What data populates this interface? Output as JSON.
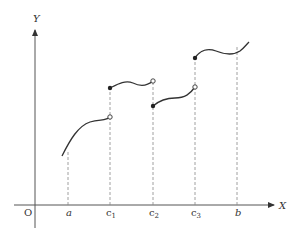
{
  "axes": {
    "x_label": "X",
    "y_label": "Y",
    "origin_label": "O"
  },
  "ticks": [
    {
      "id": "a",
      "label": "a",
      "x": 68
    },
    {
      "id": "c1",
      "label": "c",
      "sub": "1",
      "x": 110
    },
    {
      "id": "c2",
      "label": "c",
      "sub": "2",
      "x": 153
    },
    {
      "id": "c3",
      "label": "c",
      "sub": "3",
      "x": 195
    },
    {
      "id": "b",
      "label": "b",
      "x": 237
    }
  ],
  "pieces": [
    {
      "id": "piece-1",
      "start": "none",
      "end": "open"
    },
    {
      "id": "piece-2",
      "start": "filled",
      "end": "open"
    },
    {
      "id": "piece-3",
      "start": "filled",
      "end": "open"
    },
    {
      "id": "piece-4",
      "start": "filled",
      "end": "none"
    }
  ],
  "colors": {
    "axis": "#555555",
    "curve": "#333333",
    "dash": "#888888"
  }
}
